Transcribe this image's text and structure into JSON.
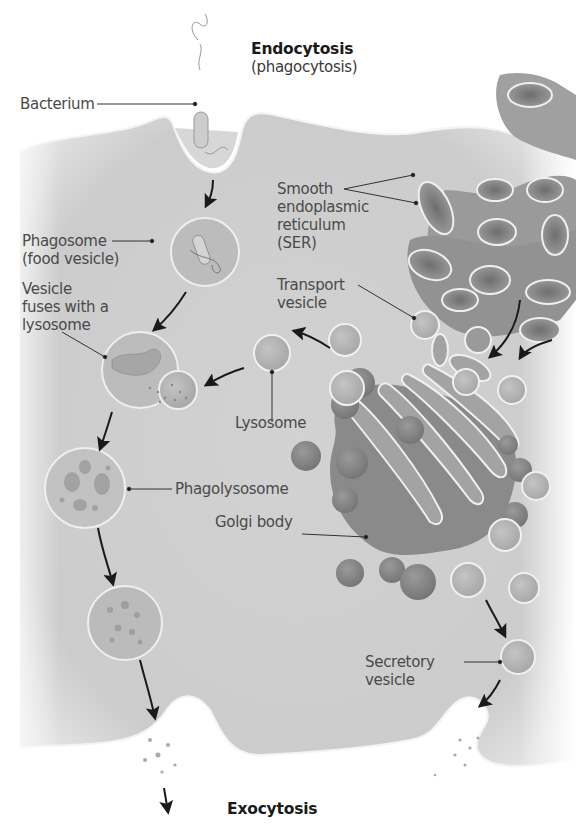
{
  "diagram": {
    "title_top": "Endocytosis",
    "subtitle_top": "(phagocytosis)",
    "title_bottom": "Exocytosis",
    "labels": {
      "bacterium": "Bacterium",
      "phagosome": "Phagosome\n(food vesicle)",
      "vesicle_fuses": "Vesicle\nfuses with a\nlysosome",
      "phagolysosome": "Phagolysosome",
      "ser": "Smooth\nendoplasmic\nreticulum\n(SER)",
      "transport_vesicle": "Transport\nvesicle",
      "lysosome": "Lysosome",
      "golgi": "Golgi body",
      "secretory_vesicle": "Secretory\nvesicle"
    },
    "colors": {
      "cytoplasm": "#cfcfcf",
      "membrane_highlight": "#f2f2f2",
      "organelle": "#8e8e8e",
      "organelle_dark": "#777777",
      "vesicle_fill": "#b8b8b8",
      "label_text": "#4a4a4a",
      "leader_line": "#333333",
      "arrow": "#1a1a1a"
    }
  }
}
